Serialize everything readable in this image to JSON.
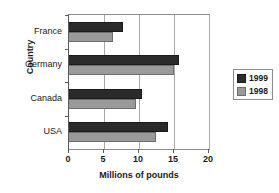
{
  "chart_data": {
    "type": "bar",
    "orientation": "horizontal",
    "title": "",
    "xlabel": "Millions of pounds",
    "ylabel": "Country",
    "categories": [
      "France",
      "Germany",
      "Canada",
      "USA"
    ],
    "series": [
      {
        "name": "1999",
        "color": "#2b2b2b",
        "values": [
          7.7,
          15.7,
          10.4,
          14.2
        ]
      },
      {
        "name": "1998",
        "color": "#9a9a9a",
        "values": [
          6.3,
          15.0,
          9.6,
          12.4
        ]
      }
    ],
    "xlim": [
      0,
      20
    ],
    "xticks": [
      0,
      5,
      10,
      15,
      20
    ],
    "xtick_labels": [
      "0",
      "5",
      "10",
      "15",
      "20"
    ],
    "grid": "vertical",
    "legend_position": "right"
  },
  "legend": {
    "entries": [
      {
        "label": "1999"
      },
      {
        "label": "1998"
      }
    ]
  }
}
